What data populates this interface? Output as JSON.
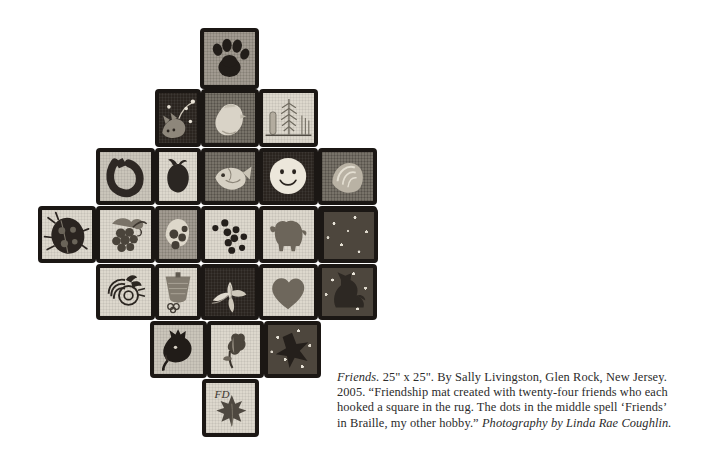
{
  "page": {
    "background_color": "#ffffff",
    "width": 714,
    "height": 464
  },
  "artwork": {
    "name": "Friends",
    "shape": "stepped cross / diamond of hooked squares",
    "square_count": 24,
    "alt": "Hooked rug titled Friends, twenty-four square blocks arranged in a stepped cross shape, each block showing a different motif."
  },
  "caption": {
    "title": "Friends.",
    "dimensions": "25\" x 25\".",
    "byline": "By Sally Livingston, Glen Rock, New Jersey.",
    "year": "2005.",
    "quote": "“Friendship mat created with twenty-four friends who each hooked a square in the rug. The dots in the middle spell ‘Friends’ in Braille, my other hobby.”",
    "credit": "Photography by Linda Rae Coughlin.",
    "full_text": "Friends. 25\" x 25\". By Sally Livingston, Glen Rock, New Jersey. 2005. “Friendship mat created with twenty-four friends who each hooked a square in the rug. The dots in the middle spell ‘Friends’ in Braille, my other hobby.” Photography by Linda Rae Coughlin."
  },
  "rug": {
    "binding_color": "#1b1714",
    "rows": [
      {
        "row": 1,
        "cells": [
          "paw-print"
        ]
      },
      {
        "row": 2,
        "cells": [
          "cat-with-vine",
          "chick",
          "wheat-sheaf"
        ]
      },
      {
        "row": 3,
        "cells": [
          "horseshoe",
          "pomegranate",
          "fish",
          "smiley-face",
          "shell"
        ]
      },
      {
        "row": 4,
        "cells": [
          "ladybug",
          "grapes",
          "berries",
          "braille-dots",
          "bison",
          "oak-leaf-acorn",
          "dark-field"
        ]
      },
      {
        "row": 5,
        "cells": [
          "bee-spiral",
          "basket",
          "lily-flower",
          "heart",
          "cat-silhouette"
        ]
      },
      {
        "row": 6,
        "cells": [
          "horse-head",
          "tulip",
          "star-speckle"
        ]
      },
      {
        "row": 7,
        "cells": [
          "maple-leaf-initials"
        ]
      }
    ],
    "motif_labels": {
      "paw-print": "paw print",
      "cat-with-vine": "cat with vine",
      "chick": "chick",
      "wheat-sheaf": "wheat sheaf",
      "horseshoe": "horseshoe",
      "pomegranate": "pomegranate",
      "fish": "fish",
      "smiley-face": "smiley face",
      "shell": "shell",
      "ladybug": "ladybug",
      "grapes": "grapes",
      "berries": "berries",
      "braille-dots": "Braille dots spelling Friends",
      "bison": "bison",
      "oak-leaf-acorn": "oak leaf and acorn",
      "dark-field": "dark speckled field",
      "bee-spiral": "bee and spiral",
      "basket": "basket",
      "lily-flower": "lily flower",
      "heart": "heart",
      "cat-silhouette": "cat silhouette",
      "horse-head": "horse head",
      "tulip": "tulip",
      "star-speckle": "star on speckled ground",
      "maple-leaf-initials": "maple leaf with initials"
    }
  }
}
